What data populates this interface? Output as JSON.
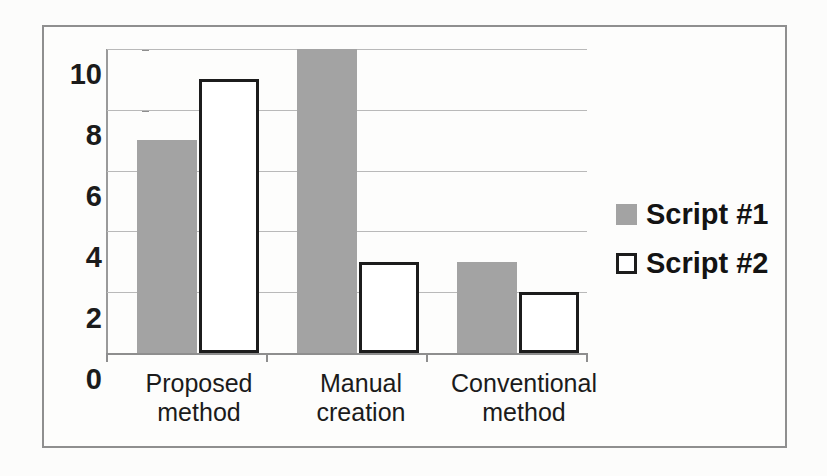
{
  "chart_data": {
    "type": "bar",
    "title": "",
    "subtitle": "",
    "xlabel": "",
    "ylabel": "",
    "categories": [
      "Proposed\nmethod",
      "Manual\ncreation",
      "Conventional\nmethod"
    ],
    "category_lines": [
      [
        "Proposed",
        "method"
      ],
      [
        "Manual",
        "creation"
      ],
      [
        "Conventional",
        "method"
      ]
    ],
    "series": [
      {
        "name": "Script #1",
        "values": [
          7,
          10,
          3
        ],
        "color": "#a3a3a3",
        "style": "filled"
      },
      {
        "name": "Script #2",
        "values": [
          9,
          3,
          2
        ],
        "color": "#ffffff",
        "style": "outlined"
      }
    ],
    "ylim": [
      0,
      10
    ],
    "yticks": [
      0,
      2,
      4,
      6,
      8,
      10
    ],
    "ytick_labels": [
      "0",
      "2",
      "4",
      "6",
      "8",
      "10"
    ],
    "grid": true,
    "grid_axis": "y",
    "legend_position": "right"
  },
  "legend": {
    "entries": [
      {
        "label": "Script #1",
        "swatch": "legend-swatch-filled-gray"
      },
      {
        "label": "Script #2",
        "swatch": "legend-swatch-outlined-white"
      }
    ]
  },
  "axis": {
    "y_labels": [
      "10",
      "8",
      "6",
      "4",
      "2",
      "0"
    ]
  },
  "colors": {
    "series_1": "#a3a3a3",
    "series_2_fill": "#ffffff",
    "series_2_stroke": "#1c1c1c",
    "gridline": "#b9b9b9",
    "axis": "#8e8e8e",
    "frame": "#8f8f8f",
    "background": "#fcfcfb",
    "text": "#1b1b1b"
  }
}
